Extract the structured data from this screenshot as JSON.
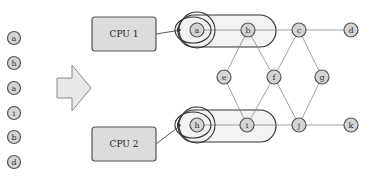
{
  "queue": {
    "items": [
      {
        "label": "a",
        "x": 14,
        "y": 38
      },
      {
        "label": "h",
        "x": 14,
        "y": 63
      },
      {
        "label": "a",
        "x": 14,
        "y": 88
      },
      {
        "label": "i",
        "x": 14,
        "y": 113
      },
      {
        "label": "b",
        "x": 14,
        "y": 137
      },
      {
        "label": "d",
        "x": 14,
        "y": 162
      }
    ]
  },
  "cpus": [
    {
      "label": "CPU 1",
      "x": 92,
      "y": 17,
      "w": 64,
      "h": 34
    },
    {
      "label": "CPU 2",
      "x": 92,
      "y": 127,
      "w": 64,
      "h": 34
    }
  ],
  "graph": {
    "nodes": [
      {
        "id": "a",
        "label": "a",
        "x": 197,
        "y": 30
      },
      {
        "id": "b",
        "label": "b",
        "x": 248,
        "y": 30
      },
      {
        "id": "c",
        "label": "c",
        "x": 299,
        "y": 30
      },
      {
        "id": "d",
        "label": "d",
        "x": 351,
        "y": 30
      },
      {
        "id": "e",
        "label": "e",
        "x": 224,
        "y": 77
      },
      {
        "id": "f",
        "label": "f",
        "x": 274,
        "y": 77
      },
      {
        "id": "g",
        "label": "g",
        "x": 322,
        "y": 77
      },
      {
        "id": "h",
        "label": "h",
        "x": 197,
        "y": 125
      },
      {
        "id": "i",
        "label": "i",
        "x": 247,
        "y": 125
      },
      {
        "id": "j",
        "label": "j",
        "x": 299,
        "y": 125
      },
      {
        "id": "k",
        "label": "k",
        "x": 351,
        "y": 125
      }
    ],
    "edges": [
      [
        "a",
        "b"
      ],
      [
        "b",
        "c"
      ],
      [
        "c",
        "d"
      ],
      [
        "b",
        "e"
      ],
      [
        "b",
        "f"
      ],
      [
        "c",
        "f"
      ],
      [
        "c",
        "g"
      ],
      [
        "e",
        "i"
      ],
      [
        "f",
        "i"
      ],
      [
        "f",
        "j"
      ],
      [
        "g",
        "j"
      ],
      [
        "h",
        "i"
      ],
      [
        "i",
        "j"
      ],
      [
        "j",
        "k"
      ]
    ]
  },
  "groups": [
    {
      "name": "cpu1-group",
      "x": 178,
      "y": 15,
      "w": 98,
      "h": 32,
      "ring": {
        "cx": 197,
        "cy": 30,
        "r": 18
      }
    },
    {
      "name": "cpu2-group",
      "x": 178,
      "y": 110,
      "w": 98,
      "h": 32,
      "ring": {
        "cx": 197,
        "cy": 125,
        "r": 18
      }
    }
  ],
  "colors": {
    "node_fill": "#d4d4d4",
    "node_stroke": "#555555",
    "cpu_fill": "#dcdcdc",
    "group_fill": "#eeeeee",
    "arrow_fill": "#e8e8e8"
  }
}
